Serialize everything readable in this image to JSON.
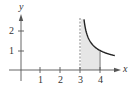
{
  "chart_data": {
    "type": "area",
    "title": "",
    "xlabel": "x",
    "ylabel": "y",
    "xlim": [
      -0.5,
      5
    ],
    "ylim": [
      -0.5,
      2.8
    ],
    "x_ticks": [
      "1",
      "2",
      "3",
      "4"
    ],
    "y_ticks": [
      "1",
      "2"
    ],
    "grid": false,
    "function": "y = 1/sqrt(x - 3)",
    "series": [
      {
        "name": "curve",
        "x": [
          3.15,
          3.25,
          3.5,
          3.75,
          4.0,
          4.25,
          4.5,
          4.7
        ],
        "y": [
          2.58,
          2.0,
          1.41,
          1.15,
          1.0,
          0.89,
          0.82,
          0.77
        ]
      }
    ],
    "shaded_region": {
      "x_from": 3,
      "x_to": 4,
      "color": "#e6e6e6"
    },
    "annotations": [
      {
        "type": "dashed-vertical-line",
        "x": 3
      },
      {
        "type": "solid-vertical-line",
        "x": 4
      }
    ]
  },
  "axes": {
    "x_label": "x",
    "y_label": "y",
    "x_tick_labels": [
      "1",
      "2",
      "3",
      "4"
    ],
    "y_tick_labels": [
      "1",
      "2"
    ]
  },
  "colors": {
    "axis": "#555555",
    "curve": "#222222",
    "shade": "#e6e6e6",
    "text": "#333333"
  }
}
